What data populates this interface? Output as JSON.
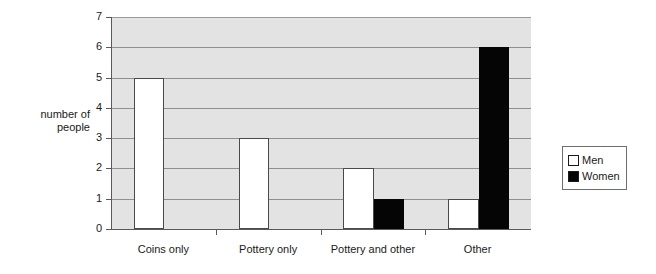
{
  "chart_data": {
    "type": "bar",
    "title": "",
    "subtitle": "",
    "xlabel": "",
    "ylabel": "number of\npeople",
    "categories": [
      "Coins only",
      "Pottery only",
      "Pottery and other",
      "Other"
    ],
    "series": [
      {
        "name": "Men",
        "values": [
          5,
          3,
          2,
          1
        ],
        "color": "#ffffff"
      },
      {
        "name": "Women",
        "values": [
          0,
          0,
          1,
          6
        ],
        "color": "#050505"
      }
    ],
    "ylim": [
      0,
      7
    ],
    "yticks": [
      0,
      1,
      2,
      3,
      4,
      5,
      6,
      7
    ],
    "ytick_labels": [
      "0",
      "1",
      "2",
      "3",
      "4",
      "5",
      "6",
      "7"
    ],
    "grid": true,
    "grid_axis": "y",
    "legend_position": "right",
    "plot_background": "#e3e3e3",
    "gridline_color": "#8f8f8f",
    "axis_color": "#5a5a5a"
  },
  "legend": {
    "entries": [
      {
        "label": "Men",
        "swatch": "white-square-icon"
      },
      {
        "label": "Women",
        "swatch": "black-square-icon"
      }
    ]
  },
  "axis": {
    "y_title_line1": "number of",
    "y_title_line2": "people"
  }
}
